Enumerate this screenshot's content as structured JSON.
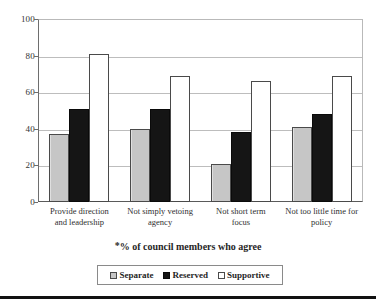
{
  "chart_data": {
    "type": "bar",
    "title": "",
    "subtitle": "",
    "xlabel": "",
    "ylabel": "",
    "ylim": [
      0,
      100
    ],
    "ytick_values": [
      100,
      80,
      60,
      40,
      20,
      0
    ],
    "ytick_labels": [
      "100",
      "80",
      "60",
      "40",
      "20",
      "0"
    ],
    "grid": "horizontal",
    "legend_position": "bottom",
    "annotation": "*% of council members who agree",
    "annotation_star": "*",
    "annotation_text": "% of council members who agree",
    "categories": [
      "Provide direction and leadership",
      "Not simply vetoing agency",
      "Not short term focus",
      "Not too little time for policy"
    ],
    "category_lines": [
      [
        "Provide direction",
        "and leadership"
      ],
      [
        "Not simply vetoing",
        "agency"
      ],
      [
        "Not short term",
        "focus"
      ],
      [
        "Not too little time for",
        "policy"
      ]
    ],
    "series": [
      {
        "name": "Separate",
        "color": "#c6c6c6",
        "values": [
          37,
          40,
          21,
          41
        ]
      },
      {
        "name": "Reserved",
        "color": "#151515",
        "values": [
          51,
          51,
          38,
          48
        ]
      },
      {
        "name": "Supportive",
        "color": "#ffffff",
        "values": [
          81,
          69,
          66,
          69
        ]
      }
    ]
  },
  "legend": {
    "items": [
      {
        "label": "Separate",
        "swatch": "separate-swatch"
      },
      {
        "label": "Reserved",
        "swatch": "reserved-swatch"
      },
      {
        "label": "Supportive",
        "swatch": "supportive-swatch"
      }
    ]
  }
}
